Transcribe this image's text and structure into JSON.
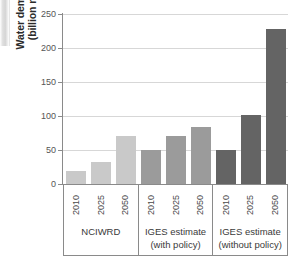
{
  "chart_data": {
    "type": "bar",
    "title": "",
    "subtitle": "",
    "xlabel": "",
    "ylabel": "Water demand (billion m³)",
    "ylabel_lines": [
      "Water demand",
      "(billion m³)"
    ],
    "ylim": [
      0,
      250
    ],
    "ytick_values": [
      0,
      50,
      100,
      150,
      200,
      250
    ],
    "ytick_labels": [
      "0",
      "50",
      "100",
      "150",
      "200",
      "250"
    ],
    "grid": "horizontal",
    "legend": "none",
    "categories": [
      "2010",
      "2025",
      "2050"
    ],
    "groups": [
      "NCIWRD",
      "IGES estimate (with policy)",
      "IGES estimate (without policy)"
    ],
    "series": [
      {
        "name": "NCIWRD",
        "name_lines": [
          "NCIWRD"
        ],
        "color": "#c9c9c9",
        "values": [
          19,
          33,
          70
        ]
      },
      {
        "name": "IGES estimate (with policy)",
        "name_lines": [
          "IGES estimate",
          "(with policy)"
        ],
        "color": "#9b9b9b",
        "values": [
          50,
          70,
          84
        ]
      },
      {
        "name": "IGES estimate (without policy)",
        "name_lines": [
          "IGES estimate",
          "(without policy)"
        ],
        "color": "#646464",
        "values": [
          50,
          102,
          228
        ]
      }
    ],
    "axis_color": "#8a8a8a",
    "grid_color": "#d7d7d7"
  }
}
